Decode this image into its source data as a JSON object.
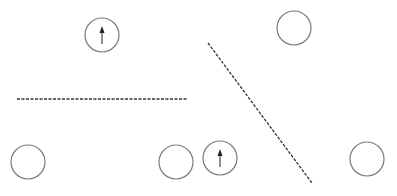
{
  "diagram": {
    "width": 397,
    "height": 196,
    "background": "#ffffff",
    "stroke_color": "#7a7a7a",
    "line_color": "#333333",
    "arrow_color": "#222222",
    "circles": [
      {
        "id": "circle-1",
        "cx": 102,
        "cy": 35,
        "r": 17,
        "arrow": "up"
      },
      {
        "id": "circle-2",
        "cx": 294,
        "cy": 28,
        "r": 17,
        "arrow": null
      },
      {
        "id": "circle-3",
        "cx": 28,
        "cy": 162,
        "r": 17,
        "arrow": null
      },
      {
        "id": "circle-4",
        "cx": 176,
        "cy": 162,
        "r": 17,
        "arrow": null
      },
      {
        "id": "circle-5",
        "cx": 220,
        "cy": 158,
        "r": 17,
        "arrow": "up"
      },
      {
        "id": "circle-6",
        "cx": 367,
        "cy": 159,
        "r": 17,
        "arrow": null
      }
    ],
    "dashed_lines": [
      {
        "id": "line-horizontal",
        "x1": 17,
        "y1": 99,
        "x2": 188,
        "y2": 99
      },
      {
        "id": "line-diagonal",
        "x1": 208,
        "y1": 43,
        "x2": 312,
        "y2": 183
      }
    ]
  }
}
